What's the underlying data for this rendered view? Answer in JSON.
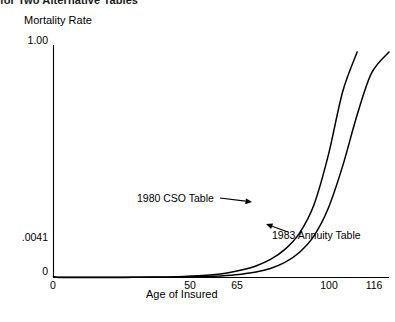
{
  "page": {
    "cropped_heading": "for Two Alternative Tables"
  },
  "chart_data": {
    "type": "line",
    "title": "",
    "ylabel": "Mortality Rate",
    "xlabel": "Age of Insured",
    "xlim": [
      0,
      116
    ],
    "ylim": [
      0,
      1.0
    ],
    "grid": false,
    "legend_position": "inline-annotations",
    "y_ticks": [
      {
        "value": 1.0,
        "label": "1.00"
      },
      {
        "value": 0.0041,
        "label": ".0041"
      },
      {
        "value": 0,
        "label": "0"
      }
    ],
    "x_ticks": [
      {
        "value": 0,
        "label": "0"
      },
      {
        "value": 50,
        "label": "50"
      },
      {
        "value": 65,
        "label": "65"
      },
      {
        "value": 100,
        "label": "100"
      },
      {
        "value": 116,
        "label": "116"
      }
    ],
    "annotations": [
      {
        "text": "1980 CSO Table",
        "points_to": "series-1980-cso"
      },
      {
        "text": "1983 Annuity Table",
        "points_to": "series-1983-annuity"
      }
    ],
    "series": [
      {
        "name": "1980 CSO Table",
        "color": "#000000",
        "x": [
          0,
          1,
          2,
          4,
          7,
          10,
          15,
          20,
          25,
          30,
          35,
          40,
          45,
          50,
          55,
          60,
          65,
          70,
          75,
          80,
          85,
          90,
          95,
          100,
          105
        ],
        "y": [
          0.0041,
          0.0011,
          0.00091,
          0.00078,
          0.00073,
          0.00073,
          0.0009,
          0.00118,
          0.00129,
          0.00135,
          0.00173,
          0.00262,
          0.00439,
          0.00746,
          0.01215,
          0.01974,
          0.03185,
          0.04965,
          0.07753,
          0.12098,
          0.19016,
          0.31084,
          0.52503,
          0.8,
          0.97
        ]
      },
      {
        "name": "1983 Annuity Table",
        "color": "#000000",
        "x": [
          0,
          1,
          2,
          4,
          7,
          10,
          15,
          20,
          25,
          30,
          35,
          40,
          45,
          50,
          55,
          60,
          65,
          70,
          75,
          80,
          85,
          90,
          95,
          100,
          105,
          110,
          116
        ],
        "y": [
          0.00095,
          0.00055,
          0.00042,
          0.00035,
          0.00032,
          0.00032,
          0.00037,
          0.00044,
          0.00051,
          0.00062,
          0.00085,
          0.00131,
          0.00215,
          0.00353,
          0.00564,
          0.00902,
          0.01444,
          0.02353,
          0.03905,
          0.06499,
          0.10777,
          0.1778,
          0.2979,
          0.48,
          0.7,
          0.88,
          0.97
        ]
      }
    ]
  }
}
